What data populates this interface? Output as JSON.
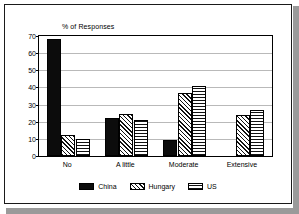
{
  "chart_data": {
    "type": "bar",
    "title": "",
    "ylabel": "% of Responses",
    "xlabel": "",
    "categories": [
      "No",
      "A little",
      "Moderate",
      "Extensive"
    ],
    "series": [
      {
        "name": "China",
        "values": [
          68,
          22,
          9.5,
          0
        ],
        "pattern": "solid-black",
        "color": "#0c0c0c"
      },
      {
        "name": "Hungary",
        "values": [
          12,
          24.5,
          37,
          24
        ],
        "pattern": "diagonal-hatch",
        "color": "#111111"
      },
      {
        "name": "US",
        "values": [
          10,
          21,
          41,
          27
        ],
        "pattern": "cross-hatch",
        "color": "#111111"
      }
    ],
    "ylim": [
      0,
      70
    ],
    "yticks": [
      0,
      10,
      20,
      30,
      40,
      50,
      60,
      70
    ],
    "ytick_labels": [
      "0",
      "10",
      "20",
      "30",
      "40",
      "50",
      "60",
      "70"
    ],
    "grid": true,
    "legend_position": "bottom"
  },
  "legend": {
    "entries": [
      {
        "label": "China"
      },
      {
        "label": "Hungary"
      },
      {
        "label": "US"
      }
    ]
  }
}
